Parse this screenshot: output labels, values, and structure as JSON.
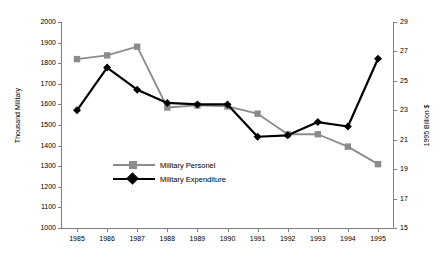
{
  "chart_data": {
    "type": "line",
    "title": "",
    "xlabel": "",
    "ylabel": "Thousand Military",
    "y2label": "1995 Billion $",
    "categories": [
      "1985",
      "1986",
      "1987",
      "1988",
      "1989",
      "1990",
      "1991",
      "1992",
      "1993",
      "1994",
      "1995"
    ],
    "x": [
      1985,
      1986,
      1987,
      1988,
      1989,
      1990,
      1991,
      1992,
      1993,
      1994,
      1995
    ],
    "ylim": [
      1000,
      2000
    ],
    "yticks": [
      1000,
      1100,
      1200,
      1300,
      1400,
      1500,
      1600,
      1700,
      1800,
      1900,
      2000
    ],
    "y2lim": [
      15,
      29
    ],
    "y2ticks": [
      15,
      17,
      19,
      21,
      23,
      25,
      27,
      29
    ],
    "grid": false,
    "legend_position": "inside-lower-left",
    "series": [
      {
        "name": "Military Personel",
        "axis": "left",
        "color": "#8c8c8c",
        "marker": "square",
        "values": [
          1820,
          1838,
          1880,
          1585,
          1595,
          1590,
          1555,
          1455,
          1455,
          1395,
          1310
        ]
      },
      {
        "name": "Military Expenditure",
        "axis": "right",
        "color": "#000000",
        "marker": "diamond",
        "values": [
          23.0,
          25.9,
          24.4,
          23.5,
          23.4,
          23.4,
          21.2,
          21.3,
          22.2,
          21.9,
          26.5
        ]
      }
    ]
  },
  "legend": {
    "items": [
      {
        "label": "Military Personel",
        "color": "#8c8c8c",
        "marker": "square"
      },
      {
        "label": "Military Expenditure",
        "color": "#000000",
        "marker": "diamond"
      }
    ]
  },
  "colors": {
    "personnel": "#8c8c8c",
    "expenditure": "#000000",
    "axis": "#7f7f7f",
    "background": "#ffffff"
  }
}
